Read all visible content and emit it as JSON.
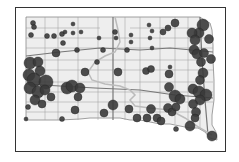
{
  "map": {
    "region": "South Dakota",
    "type": "proportional-symbol",
    "colors": {
      "state_fill": "#eeeeee",
      "boundary": "#888888",
      "road": "#777777",
      "river": "#aaaaaa",
      "symbol": "#3a3a3a",
      "frame": "#333333"
    },
    "symbols": [
      {
        "x": 33,
        "y": 23,
        "r": 2.5
      },
      {
        "x": 34,
        "y": 27,
        "r": 2.5
      },
      {
        "x": 31,
        "y": 35,
        "r": 2.5
      },
      {
        "x": 47,
        "y": 36,
        "r": 2.5
      },
      {
        "x": 54,
        "y": 36,
        "r": 2.5
      },
      {
        "x": 62,
        "y": 34,
        "r": 2.5
      },
      {
        "x": 65,
        "y": 32,
        "r": 2
      },
      {
        "x": 73,
        "y": 24,
        "r": 2
      },
      {
        "x": 73,
        "y": 33,
        "r": 2
      },
      {
        "x": 81,
        "y": 32,
        "r": 2
      },
      {
        "x": 63,
        "y": 43,
        "r": 2.5
      },
      {
        "x": 56,
        "y": 53,
        "r": 4
      },
      {
        "x": 77,
        "y": 50,
        "r": 2.5
      },
      {
        "x": 103,
        "y": 50,
        "r": 2.5
      },
      {
        "x": 97,
        "y": 62,
        "r": 2.5
      },
      {
        "x": 99,
        "y": 38,
        "r": 2
      },
      {
        "x": 115,
        "y": 32,
        "r": 2.5
      },
      {
        "x": 116,
        "y": 38,
        "r": 2
      },
      {
        "x": 131,
        "y": 35,
        "r": 2
      },
      {
        "x": 131,
        "y": 42,
        "r": 2
      },
      {
        "x": 127,
        "y": 50,
        "r": 2.5
      },
      {
        "x": 149,
        "y": 25,
        "r": 2
      },
      {
        "x": 152,
        "y": 31,
        "r": 2
      },
      {
        "x": 150,
        "y": 38,
        "r": 2
      },
      {
        "x": 152,
        "y": 48,
        "r": 2
      },
      {
        "x": 163,
        "y": 32,
        "r": 3
      },
      {
        "x": 168,
        "y": 28,
        "r": 3
      },
      {
        "x": 175,
        "y": 23,
        "r": 4
      },
      {
        "x": 85,
        "y": 72,
        "r": 4
      },
      {
        "x": 118,
        "y": 72,
        "r": 4
      },
      {
        "x": 146,
        "y": 71,
        "r": 3.5
      },
      {
        "x": 151,
        "y": 69,
        "r": 3.5
      },
      {
        "x": 170,
        "y": 67,
        "r": 2
      },
      {
        "x": 169,
        "y": 74,
        "r": 4
      },
      {
        "x": 30,
        "y": 63,
        "r": 6
      },
      {
        "x": 38,
        "y": 62,
        "r": 5
      },
      {
        "x": 40,
        "y": 71,
        "r": 5
      },
      {
        "x": 29,
        "y": 75,
        "r": 6
      },
      {
        "x": 34,
        "y": 80,
        "r": 7
      },
      {
        "x": 46,
        "y": 82,
        "r": 7
      },
      {
        "x": 30,
        "y": 88,
        "r": 6
      },
      {
        "x": 38,
        "y": 92,
        "r": 6
      },
      {
        "x": 45,
        "y": 90,
        "r": 5
      },
      {
        "x": 51,
        "y": 97,
        "r": 4
      },
      {
        "x": 35,
        "y": 100,
        "r": 5
      },
      {
        "x": 42,
        "y": 104,
        "r": 4
      },
      {
        "x": 28,
        "y": 107,
        "r": 2.5
      },
      {
        "x": 26,
        "y": 119,
        "r": 2
      },
      {
        "x": 67,
        "y": 88,
        "r": 6
      },
      {
        "x": 72,
        "y": 86,
        "r": 6
      },
      {
        "x": 80,
        "y": 88,
        "r": 5
      },
      {
        "x": 78,
        "y": 97,
        "r": 4
      },
      {
        "x": 75,
        "y": 110,
        "r": 4
      },
      {
        "x": 62,
        "y": 119,
        "r": 2.5
      },
      {
        "x": 104,
        "y": 113,
        "r": 4
      },
      {
        "x": 113,
        "y": 105,
        "r": 5
      },
      {
        "x": 129,
        "y": 109,
        "r": 4
      },
      {
        "x": 137,
        "y": 118,
        "r": 4
      },
      {
        "x": 147,
        "y": 118,
        "r": 4
      },
      {
        "x": 151,
        "y": 109,
        "r": 4.5
      },
      {
        "x": 157,
        "y": 118,
        "r": 4
      },
      {
        "x": 161,
        "y": 121,
        "r": 4
      },
      {
        "x": 168,
        "y": 108,
        "r": 4.5
      },
      {
        "x": 172,
        "y": 112,
        "r": 4
      },
      {
        "x": 176,
        "y": 107,
        "r": 4
      },
      {
        "x": 169,
        "y": 87,
        "r": 4.5
      },
      {
        "x": 175,
        "y": 96,
        "r": 6
      },
      {
        "x": 180,
        "y": 99,
        "r": 5
      },
      {
        "x": 176,
        "y": 129,
        "r": 2.5
      },
      {
        "x": 190,
        "y": 126,
        "r": 5
      },
      {
        "x": 203,
        "y": 25,
        "r": 6
      },
      {
        "x": 199,
        "y": 33,
        "r": 5
      },
      {
        "x": 192,
        "y": 33,
        "r": 5
      },
      {
        "x": 195,
        "y": 40,
        "r": 5
      },
      {
        "x": 209,
        "y": 39,
        "r": 4.5
      },
      {
        "x": 194,
        "y": 50,
        "r": 5
      },
      {
        "x": 197,
        "y": 54,
        "r": 5
      },
      {
        "x": 204,
        "y": 53,
        "r": 4.5
      },
      {
        "x": 211,
        "y": 59,
        "r": 4.5
      },
      {
        "x": 201,
        "y": 62,
        "r": 4.5
      },
      {
        "x": 203,
        "y": 73,
        "r": 5
      },
      {
        "x": 200,
        "y": 80,
        "r": 4.5
      },
      {
        "x": 193,
        "y": 89,
        "r": 5
      },
      {
        "x": 199,
        "y": 92,
        "r": 6
      },
      {
        "x": 206,
        "y": 95,
        "r": 6
      },
      {
        "x": 200,
        "y": 100,
        "r": 5
      },
      {
        "x": 193,
        "y": 104,
        "r": 4.5
      },
      {
        "x": 196,
        "y": 112,
        "r": 4.5
      },
      {
        "x": 195,
        "y": 118,
        "r": 4
      },
      {
        "x": 212,
        "y": 136,
        "r": 5
      }
    ]
  }
}
